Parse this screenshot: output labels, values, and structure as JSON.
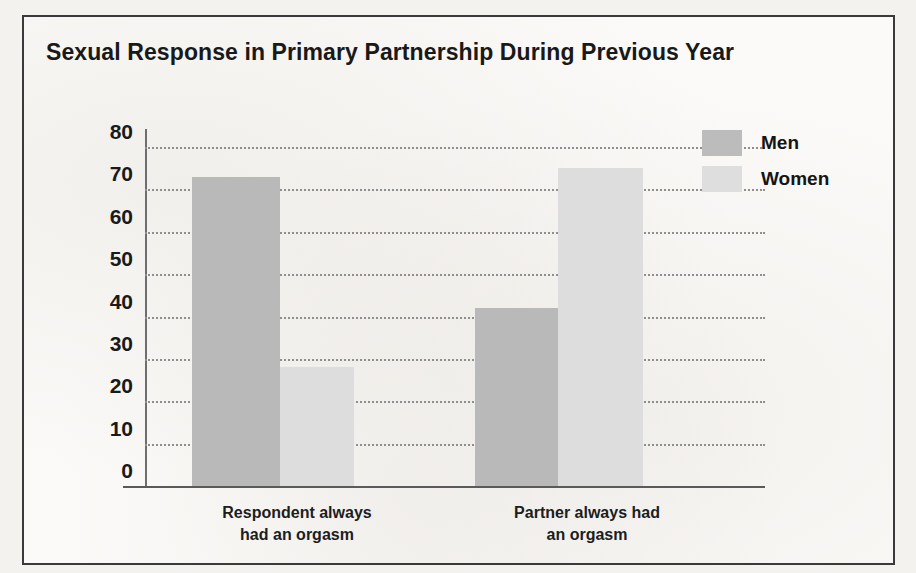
{
  "chart_data": {
    "type": "bar",
    "title": "Sexual Response in Primary Partnership During Previous Year",
    "categories": [
      "Respondent always had an orgasm",
      "Partner always had an orgasm"
    ],
    "category_lines": [
      [
        "Respondent always",
        "had an orgasm"
      ],
      [
        "Partner always had",
        "an orgasm"
      ]
    ],
    "series": [
      {
        "name": "Men",
        "values": [
          73,
          42
        ],
        "color": "#b9b9b9"
      },
      {
        "name": "Women",
        "values": [
          28,
          75
        ],
        "color": "#dddddd"
      }
    ],
    "xlabel": "",
    "ylabel": "",
    "ylim": [
      0,
      80
    ],
    "ytick_values": [
      0,
      10,
      20,
      30,
      40,
      50,
      60,
      70,
      80
    ],
    "ytick_labels": [
      "0",
      "10",
      "20",
      "30",
      "40",
      "50",
      "60",
      "70",
      "80"
    ],
    "grid": true,
    "grid_style": "dotted",
    "legend_position": "top-right",
    "legend_entries": [
      "Men",
      "Women"
    ]
  },
  "frame": {
    "border_color": "#3a3a3a",
    "background": "#fbfaf8"
  }
}
